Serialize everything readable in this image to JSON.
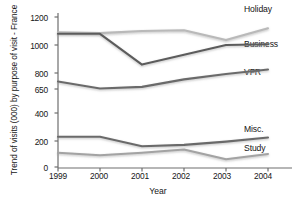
{
  "chart_data": {
    "type": "line",
    "title": "",
    "ylabel": "Trend of visits (000) by purpose of visit - France",
    "xlabel": "Year",
    "x": [
      "1999",
      "2000",
      "2001",
      "2002",
      "2003",
      "2004"
    ],
    "ytick_labels": [
      "0",
      "200",
      "400",
      "650",
      "800",
      "1000",
      "1200"
    ],
    "ytick_values": [
      0,
      200,
      400,
      650,
      800,
      1000,
      1200
    ],
    "ylim": [
      0,
      1200
    ],
    "grid": false,
    "legend_position": "right-inline",
    "series": [
      {
        "name": "Holiday",
        "color": "#b9b9b9",
        "values": [
          1090,
          1085,
          1100,
          1105,
          1035,
          1120
        ]
      },
      {
        "name": "Business",
        "color": "#5c5c5c",
        "values": [
          1080,
          1080,
          860,
          930,
          1000,
          1005
        ]
      },
      {
        "name": "VFR",
        "color": "#6b6b6b",
        "values": [
          720,
          655,
          670,
          740,
          790,
          825
        ]
      },
      {
        "name": "Misc.",
        "color": "#6b6b6b",
        "values": [
          230,
          230,
          160,
          170,
          195,
          225
        ]
      },
      {
        "name": "Study",
        "color": "#a3a3a3",
        "values": [
          110,
          90,
          110,
          135,
          60,
          100
        ]
      }
    ]
  },
  "axis": {
    "y_title": "Trend of visits (000) by purpose of visit - France",
    "x_title": "Year",
    "y_ticks": [
      {
        "label": "1200"
      },
      {
        "label": "1000"
      },
      {
        "label": "800"
      },
      {
        "label": "650"
      },
      {
        "label": "400"
      },
      {
        "label": "200"
      },
      {
        "label": "0"
      }
    ],
    "x_ticks": [
      {
        "label": "1999"
      },
      {
        "label": "2000"
      },
      {
        "label": "2001"
      },
      {
        "label": "2002"
      },
      {
        "label": "2003"
      },
      {
        "label": "2004"
      }
    ]
  },
  "series_labels": [
    {
      "name": "Holiday"
    },
    {
      "name": "Business"
    },
    {
      "name": "VFR"
    },
    {
      "name": "Misc."
    },
    {
      "name": "Study"
    }
  ],
  "colors": {
    "axis": "#6e6e6e",
    "text": "#161616",
    "holiday": "#b9b9b9",
    "business": "#5c5c5c",
    "vfr": "#6b6b6b",
    "misc": "#6b6b6b",
    "study": "#a3a3a3"
  }
}
